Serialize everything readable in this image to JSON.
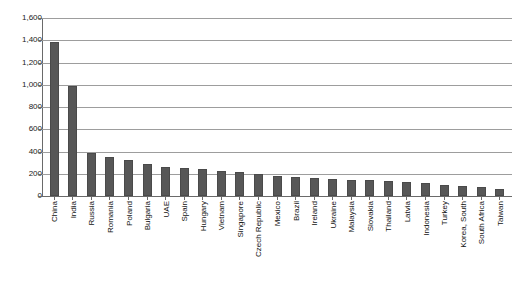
{
  "chart_data": {
    "type": "bar",
    "title": "",
    "subtitle": "",
    "xlabel": "",
    "ylabel": "",
    "ylim": [
      0,
      1600
    ],
    "ytick_labels": [
      "1,600",
      "1,400",
      "1,200",
      "1,000",
      "800",
      "600",
      "400",
      "200",
      "0"
    ],
    "ytick_values": [
      1600,
      1400,
      1200,
      1000,
      800,
      600,
      400,
      200,
      0
    ],
    "grid": "horizontal",
    "legend": "none",
    "bar_color": "#575757",
    "gridline_color": "#9d9d9d",
    "axis_color": "#6a6a6a",
    "categories": [
      "China",
      "India",
      "Russia",
      "Romania",
      "Poland",
      "Bulgaria",
      "UAE",
      "Spain",
      "Hungary",
      "Vietnam",
      "Singapore",
      "Czech Republic",
      "Mexico",
      "Brazil",
      "Ireland",
      "Ukraine",
      "Malaysia",
      "Slovakia",
      "Thailand",
      "Latvia",
      "Indonesia",
      "Turkey",
      "Korea, South",
      "South Africa",
      "Taiwan"
    ],
    "values": [
      1385,
      985,
      390,
      350,
      320,
      290,
      265,
      250,
      240,
      225,
      215,
      195,
      180,
      170,
      165,
      150,
      145,
      140,
      135,
      130,
      115,
      100,
      90,
      80,
      65
    ]
  }
}
